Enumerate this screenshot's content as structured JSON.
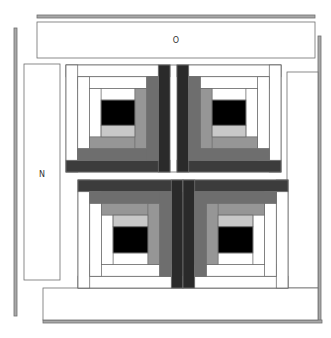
{
  "diagram": {
    "labels": {
      "top_panel": "O",
      "left_panel": "N"
    },
    "colors": {
      "background": "#ffffff",
      "outline": "#6e6e6e",
      "bar_fill": "#a8a8a8",
      "black": "#000000",
      "white": "#ffffff",
      "light_gray": "#c8c8c8",
      "medium_gray": "#969696",
      "gray": "#6e6e6e",
      "dark_gray": "#3c3c3c",
      "darkest": "#2a2a2a"
    },
    "blocks": [
      {
        "name": "top-left-block",
        "dark_side": "bottom-right"
      },
      {
        "name": "top-right-block",
        "dark_side": "bottom-left"
      },
      {
        "name": "bottom-left-block",
        "dark_side": "top-right"
      },
      {
        "name": "bottom-right-block",
        "dark_side": "top-left"
      }
    ]
  }
}
